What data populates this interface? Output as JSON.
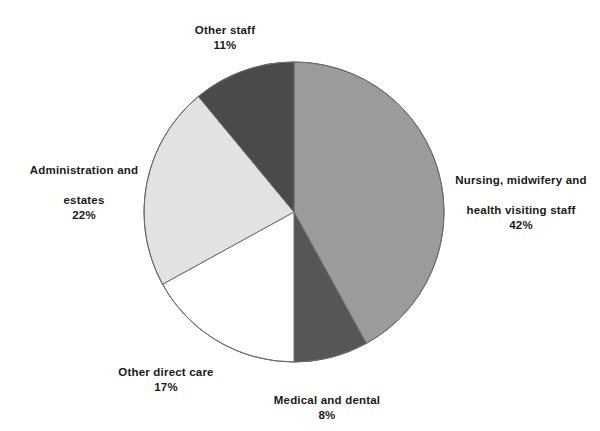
{
  "chart_data": {
    "type": "pie",
    "title": "",
    "subtitle": "",
    "xlabel": "",
    "ylabel": "",
    "legend_position": "none",
    "grid": false,
    "start_angle_deg": 0,
    "direction": "clockwise",
    "categories": [
      "Nursing, midwifery and health visiting staff",
      "Medical and dental",
      "Other direct care",
      "Administration and estates",
      "Other staff"
    ],
    "values": [
      42,
      8,
      17,
      22,
      11
    ],
    "unit": "%",
    "slices": [
      {
        "label": "Nursing, midwifery and health visiting staff",
        "label_line1": "Nursing, midwifery and",
        "label_line2": "health visiting staff",
        "value": 42,
        "value_text": "42%",
        "color": "#9b9b9b"
      },
      {
        "label": "Medical and dental",
        "label_line1": "Medical and dental",
        "label_line2": "",
        "value": 8,
        "value_text": "8%",
        "color": "#565656"
      },
      {
        "label": "Other direct care",
        "label_line1": "Other direct care",
        "label_line2": "",
        "value": 17,
        "value_text": "17%",
        "color": "#ffffff"
      },
      {
        "label": "Administration and estates",
        "label_line1": "Administration and",
        "label_line2": "estates",
        "value": 22,
        "value_text": "22%",
        "color": "#e2e2e2"
      },
      {
        "label": "Other staff",
        "label_line1": "Other staff",
        "label_line2": "",
        "value": 11,
        "value_text": "11%",
        "color": "#4a4a4a"
      }
    ]
  },
  "labels": {
    "other_staff": {
      "name": "Other staff",
      "pct": "11%"
    },
    "nursing": {
      "name_line1": "Nursing, midwifery and",
      "name_line2": "health visiting staff",
      "pct": "42%"
    },
    "administration": {
      "name_line1": "Administration and",
      "name_line2": "estates",
      "pct": "22%"
    },
    "other_direct_care": {
      "name": "Other direct care",
      "pct": "17%"
    },
    "medical_dental": {
      "name": "Medical and dental",
      "pct": "8%"
    }
  },
  "geometry": {
    "center_x": 294,
    "center_y": 212,
    "radius": 150
  },
  "colors": {
    "background": "#ffffff",
    "outline": "#6b6b6b",
    "text": "#1a1a1a"
  }
}
